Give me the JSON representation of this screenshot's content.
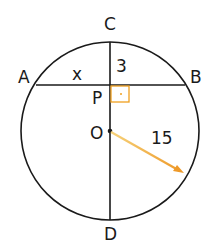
{
  "diagram": {
    "type": "circle-chord-geometry",
    "points": {
      "A": "A",
      "B": "B",
      "C": "C",
      "D": "D",
      "P": "P",
      "O": "O"
    },
    "labels": {
      "segment_AP": "x",
      "segment_CP": "3",
      "radius": "15"
    },
    "colors": {
      "stroke": "#1a1a1a",
      "right_angle": "#f0a020",
      "radius_arrow": "#f0a030"
    },
    "relations": {
      "CD_perpendicular_AB_at": "P",
      "center": "O"
    }
  }
}
